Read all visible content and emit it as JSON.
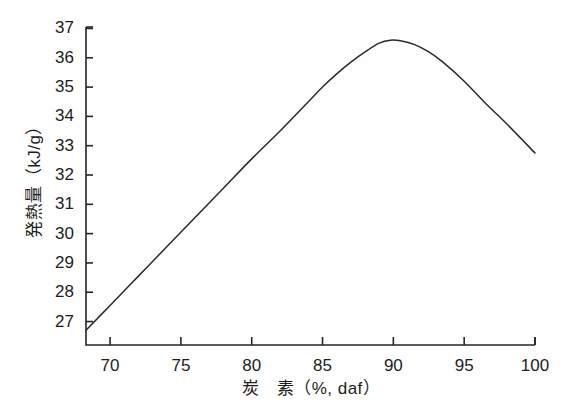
{
  "figure": {
    "background_color": "#fefefe",
    "line_color": "#2a2a2a",
    "axis_color": "#262626",
    "text_color": "#1d1d1d"
  },
  "chart_data": {
    "type": "line",
    "title": "",
    "subtitle": "",
    "xlabel": "炭　素（%, daf）",
    "ylabel": "発熱量（kJ/g）",
    "xlim": [
      68.3,
      100
    ],
    "ylim": [
      26.2,
      37.05
    ],
    "xticks": [
      70,
      75,
      80,
      85,
      90,
      95,
      100
    ],
    "xtick_labels": [
      "70",
      "75",
      "80",
      "85",
      "90",
      "95",
      "100"
    ],
    "yticks": [
      27,
      28,
      29,
      30,
      31,
      32,
      33,
      34,
      35,
      36,
      37
    ],
    "ytick_labels": [
      "27",
      "28",
      "29",
      "30",
      "31",
      "32",
      "33",
      "34",
      "35",
      "36",
      "37"
    ],
    "grid": false,
    "legend": null,
    "legend_position": "none",
    "series": [
      {
        "name": "発熱量",
        "x": [
          68.3,
          70,
          72,
          74,
          76,
          78,
          80,
          82,
          84,
          85,
          86,
          87,
          88,
          89,
          89.8,
          90.5,
          91.5,
          92.5,
          93.5,
          95,
          96.5,
          98,
          100
        ],
        "values": [
          26.7,
          27.55,
          28.55,
          29.55,
          30.55,
          31.55,
          32.55,
          33.5,
          34.5,
          35.0,
          35.45,
          35.85,
          36.2,
          36.5,
          36.6,
          36.58,
          36.45,
          36.2,
          35.85,
          35.2,
          34.45,
          33.75,
          32.75
        ]
      }
    ],
    "annotations": []
  }
}
